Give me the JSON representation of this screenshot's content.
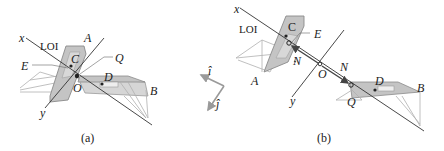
{
  "figure": {
    "panels": [
      {
        "id": "a",
        "caption": "(a)",
        "labels": {
          "x_axis": "x",
          "y_axis": "y",
          "line_of_impact": "LOI",
          "boat_a": "A",
          "boat_b": "B",
          "center_c": "C",
          "center_d": "D",
          "point_e": "E",
          "point_q": "Q",
          "origin": "O"
        }
      },
      {
        "id": "b",
        "caption": "(b)",
        "labels": {
          "x_axis": "x",
          "y_axis": "y",
          "line_of_impact": "LOI",
          "boat_a": "A",
          "boat_b": "B",
          "center_c": "C",
          "center_d": "D",
          "point_e": "E",
          "point_q": "Q",
          "origin": "O",
          "normal_force_1": "N",
          "normal_force_2": "N"
        }
      }
    ],
    "unit_vectors": {
      "i_hat": "î",
      "j_hat": "ĵ"
    },
    "colors": {
      "line": "#333333",
      "hull_fill": "#c8c8c8",
      "hull_stroke": "#8a8a8a",
      "frame_stroke": "#b0b0b0",
      "vector_gray": "#9a9a9a",
      "text": "#222222"
    }
  }
}
